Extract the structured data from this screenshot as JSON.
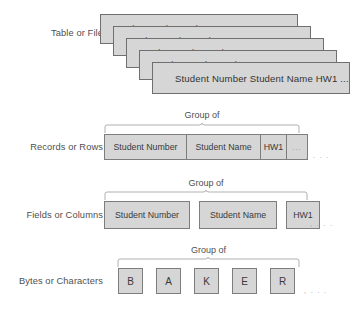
{
  "diagram": {
    "group_of_label": "Group of",
    "trailing_ellipsis": ", . . .",
    "inline_ellipsis": "...",
    "colors": {
      "box_fill": "#d6d6d6",
      "box_border": "#7d7d7d",
      "card_border": "#6f6f6f",
      "text": "#3a3a3a",
      "label_text": "#4f4f4f",
      "brace": "#b0b0b0",
      "background": "#ffffff"
    }
  },
  "tiers": [
    {
      "id": "table-or-file",
      "label": "Table or File",
      "card_text": "Student Number  Student Name  HW1",
      "front_card_text": "Student Number  Student Name  HW1  ...",
      "card_count": 5
    },
    {
      "id": "records-or-rows",
      "label": "Records or Rows",
      "cells": [
        "Student Number",
        "Student Name",
        "HW1",
        "..."
      ]
    },
    {
      "id": "fields-or-columns",
      "label": "Fields or Columns",
      "cells": [
        "Student Number",
        "Student Name",
        "HW1"
      ]
    },
    {
      "id": "bytes-or-characters",
      "label": "Bytes or Characters",
      "cells": [
        "B",
        "A",
        "K",
        "E",
        "R"
      ]
    }
  ]
}
